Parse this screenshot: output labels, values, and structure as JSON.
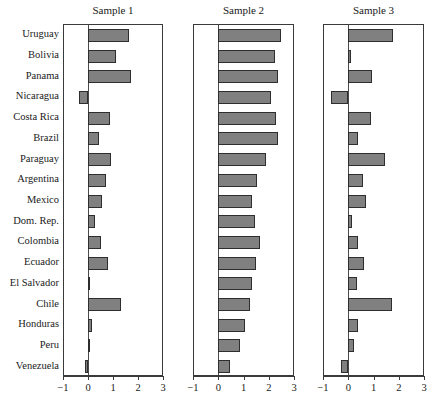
{
  "chart_data": {
    "type": "bar",
    "orientation": "horizontal",
    "title": "",
    "xlabel": "",
    "ylabel": "",
    "xlim": [
      -1,
      3
    ],
    "xticks": [
      -1,
      0,
      1,
      2,
      3
    ],
    "xtick_labels": [
      "−1",
      "0",
      "1",
      "2",
      "3"
    ],
    "grid": false,
    "legend": null,
    "panel_titles": [
      "Sample 1",
      "Sample 2",
      "Sample 3"
    ],
    "categories": [
      "Uruguay",
      "Bolivia",
      "Panama",
      "Nicaragua",
      "Costa Rica",
      "Brazil",
      "Paraguay",
      "Argentina",
      "Mexico",
      "Dom. Rep.",
      "Colombia",
      "Ecuador",
      "El Salvador",
      "Chile",
      "Honduras",
      "Peru",
      "Venezuela"
    ],
    "series": [
      {
        "name": "Sample 1",
        "values": [
          1.65,
          1.1,
          1.72,
          -0.35,
          0.87,
          0.42,
          0.93,
          0.72,
          0.55,
          0.26,
          0.5,
          0.78,
          0.04,
          1.3,
          0.16,
          0.03,
          -0.12
        ]
      },
      {
        "name": "Sample 2",
        "values": [
          2.5,
          2.25,
          2.35,
          2.1,
          2.3,
          2.35,
          1.9,
          1.55,
          1.35,
          1.45,
          1.65,
          1.5,
          1.35,
          1.25,
          1.05,
          0.85,
          0.45
        ]
      },
      {
        "name": "Sample 3",
        "values": [
          1.78,
          0.1,
          0.95,
          -0.7,
          0.92,
          0.38,
          1.45,
          0.6,
          0.72,
          0.15,
          0.38,
          0.62,
          0.33,
          1.72,
          0.38,
          0.22,
          -0.3
        ]
      }
    ],
    "colors": {
      "bar_fill": "#808080",
      "bar_stroke": "#2e2e2e",
      "axis": "#3a3a3a",
      "text": "#1a1a1a",
      "background": "#ffffff"
    }
  }
}
